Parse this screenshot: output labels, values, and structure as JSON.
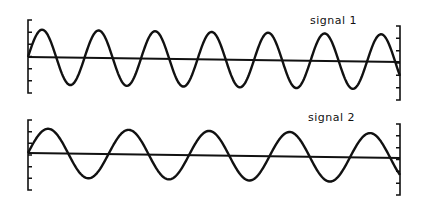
{
  "chart_data": [
    {
      "type": "line",
      "title": "signal 1",
      "label": "signal 1",
      "xlabel": "",
      "ylabel": "",
      "grid": false,
      "description": "Sinusoid with ~6.6 cycles across the window, amplitude ~1 relative to bracket scale",
      "cycles": 6.6,
      "amplitude_relative": 1.0,
      "phase": "starts at zero crossing going up",
      "y_ticks": 7,
      "geometry": {
        "x_start": 28,
        "x_end": 400,
        "baseline_y_start": 57,
        "baseline_y_end": 62,
        "amplitude_px": 27.5,
        "period_px": 56.5,
        "left_bracket": {
          "x": 28,
          "y_top": 20,
          "y_bottom": 93
        },
        "right_bracket": {
          "x": 400,
          "y_top": 26,
          "y_bottom": 100
        }
      }
    },
    {
      "type": "line",
      "title": "signal 2",
      "label": "signal 2",
      "xlabel": "",
      "ylabel": "",
      "grid": false,
      "description": "Sinusoid with ~4.6 cycles across the window, smaller amplitude than signal 1",
      "cycles": 4.6,
      "amplitude_relative": 0.9,
      "phase": "starts at zero crossing going up",
      "y_ticks": 7,
      "geometry": {
        "x_start": 28,
        "x_end": 400,
        "baseline_y_start": 153,
        "baseline_y_end": 158,
        "amplitude_px": 24.5,
        "period_px": 80.5,
        "left_bracket": {
          "x": 28,
          "y_top": 120,
          "y_bottom": 190
        },
        "right_bracket": {
          "x": 400,
          "y_top": 124,
          "y_bottom": 195
        }
      }
    }
  ],
  "labels": {
    "signal1": "signal  1",
    "signal2": "signal  2"
  }
}
